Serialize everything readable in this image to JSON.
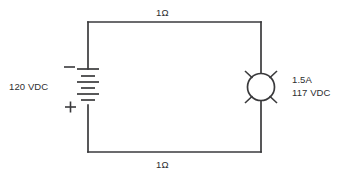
{
  "diagram": {
    "background_color": "#ffffff",
    "line_color": "#3a3a3c",
    "text_color": "#2e2e30",
    "labels": {
      "top_resistor": "1Ω",
      "bottom_resistor": "1Ω",
      "source_voltage": "120 VDC",
      "lamp_current": "1.5A",
      "lamp_voltage": "117 VDC",
      "battery_negative": "−",
      "battery_positive": "+"
    },
    "components": {
      "battery": {
        "name": "battery",
        "terminal_top": "−",
        "terminal_bottom": "+",
        "value": "120 VDC"
      },
      "lamp": {
        "name": "lamp",
        "current": "1.5A",
        "voltage": "117 VDC",
        "rays": 4
      },
      "top_wire_resistance": "1Ω",
      "bottom_wire_resistance": "1Ω"
    }
  }
}
